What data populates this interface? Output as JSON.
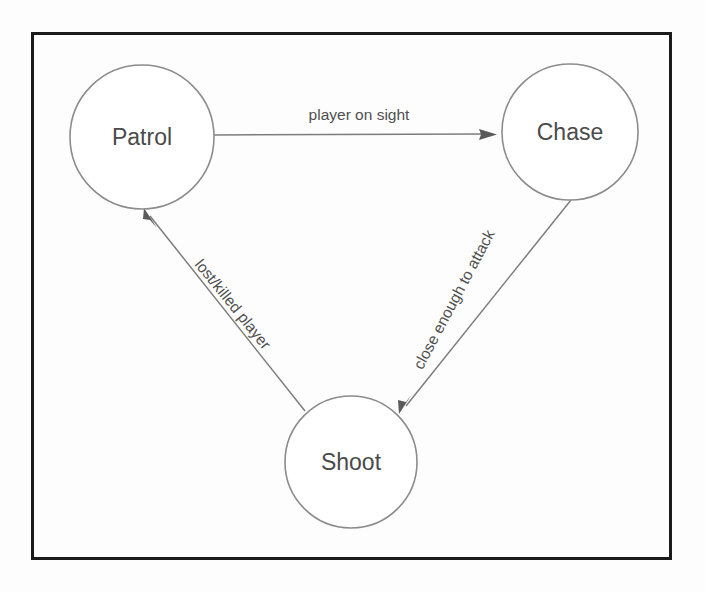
{
  "diagram": {
    "type": "state-machine",
    "title": "",
    "canvas": {
      "width": 705,
      "height": 592,
      "background": "#fdfdfd"
    },
    "frame": {
      "x": 31,
      "y": 32,
      "width": 641,
      "height": 528,
      "stroke": "#1b1b1b",
      "stroke_width": 3
    },
    "style": {
      "node_stroke": "#8c8c8c",
      "node_fill": "#ffffff",
      "edge_stroke": "#7d7d7d",
      "arrow_fill": "#5a5a5a",
      "node_text_color": "#4a4a4a",
      "edge_text_color": "#4f4f4f"
    },
    "nodes": [
      {
        "id": "patrol",
        "label": "Patrol",
        "cx": 142,
        "cy": 137,
        "r": 72
      },
      {
        "id": "chase",
        "label": "Chase",
        "cx": 570,
        "cy": 132,
        "r": 68
      },
      {
        "id": "shoot",
        "label": "Shoot",
        "cx": 351,
        "cy": 462,
        "r": 66
      }
    ],
    "edges": [
      {
        "id": "patrol-to-chase",
        "from": "patrol",
        "to": "chase",
        "label": "player on sight",
        "label_x": 359,
        "label_y": 116,
        "label_rotation": 0,
        "x1": 214,
        "y1": 135,
        "x2": 496,
        "y2": 134
      },
      {
        "id": "chase-to-shoot",
        "from": "chase",
        "to": "shoot",
        "label": "close enough to attack",
        "label_x": 455,
        "label_y": 300,
        "label_rotation": -62,
        "x1": 571,
        "y1": 200,
        "x2": 404,
        "y2": 409
      },
      {
        "id": "shoot-to-patrol",
        "from": "shoot",
        "to": "patrol",
        "label": "lost/killed player",
        "label_x": 232,
        "label_y": 305,
        "label_rotation": 57,
        "x1": 305,
        "y1": 411,
        "x2": 146,
        "y2": 210
      }
    ]
  }
}
